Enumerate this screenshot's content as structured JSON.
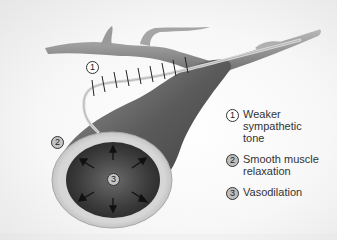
{
  "figure": {
    "labels": [
      {
        "id": "1",
        "text": "1",
        "style": "outline"
      },
      {
        "id": "2",
        "text": "2",
        "style": "filled"
      },
      {
        "id": "3",
        "text": "3",
        "style": "filled"
      }
    ],
    "arrow_count": 6,
    "nerve_tick_count": 9
  },
  "legend": {
    "items": [
      {
        "number": "1",
        "lines": [
          "Weaker",
          "sympathetic",
          "tone"
        ]
      },
      {
        "number": "2",
        "lines": [
          "Smooth muscle",
          "relaxation"
        ]
      },
      {
        "number": "3",
        "lines": [
          "Vasodilation"
        ]
      }
    ]
  },
  "colors": {
    "vessel_dark": "#4a4a4a",
    "vessel_mid": "#8a8a8a",
    "vessel_wall": "#cfcfcf",
    "lumen": "#3c3c3c",
    "background": "#f5f5f5"
  }
}
